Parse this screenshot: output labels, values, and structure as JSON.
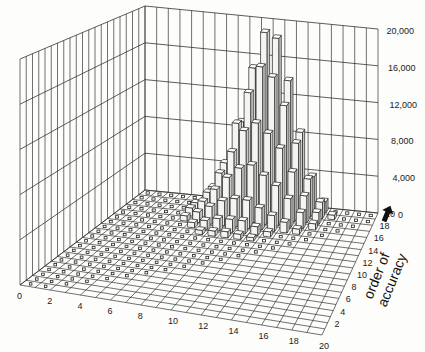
{
  "chart_data": {
    "type": "bar3d",
    "title": "",
    "xlabel": "",
    "ylabel": "order of accuracy",
    "zlabel": "",
    "x_ticks": [
      "0",
      "2",
      "4",
      "6",
      "8",
      "10",
      "12",
      "14",
      "16",
      "18",
      "20"
    ],
    "y_ticks": [
      "2",
      "4",
      "6",
      "8",
      "10",
      "12",
      "14",
      "16",
      "18",
      "20"
    ],
    "z_ticks": [
      "0",
      "4,000",
      "8,000",
      "12,000",
      "16,000",
      "20,000"
    ],
    "zlim": [
      0,
      20000
    ],
    "grid": true,
    "grid_size": [
      21,
      21
    ],
    "ylabel_arrow": "up-arrow",
    "bars": [
      {
        "x": 10,
        "y": 20,
        "z": 19000
      },
      {
        "x": 11,
        "y": 20,
        "z": 18500
      },
      {
        "x": 9,
        "y": 20,
        "z": 15000
      },
      {
        "x": 12,
        "y": 20,
        "z": 14000
      },
      {
        "x": 8,
        "y": 20,
        "z": 9000
      },
      {
        "x": 13,
        "y": 20,
        "z": 8500
      },
      {
        "x": 7,
        "y": 20,
        "z": 4000
      },
      {
        "x": 14,
        "y": 20,
        "z": 3800
      },
      {
        "x": 15,
        "y": 20,
        "z": 1200
      },
      {
        "x": 6,
        "y": 20,
        "z": 1300
      },
      {
        "x": 10,
        "y": 19,
        "z": 16000
      },
      {
        "x": 11,
        "y": 19,
        "z": 15000
      },
      {
        "x": 9,
        "y": 19,
        "z": 13000
      },
      {
        "x": 12,
        "y": 19,
        "z": 12000
      },
      {
        "x": 8,
        "y": 19,
        "z": 9500
      },
      {
        "x": 13,
        "y": 19,
        "z": 8000
      },
      {
        "x": 7,
        "y": 19,
        "z": 5000
      },
      {
        "x": 14,
        "y": 19,
        "z": 4200
      },
      {
        "x": 6,
        "y": 19,
        "z": 2200
      },
      {
        "x": 15,
        "y": 19,
        "z": 1800
      },
      {
        "x": 16,
        "y": 19,
        "z": 500
      },
      {
        "x": 10,
        "y": 18,
        "z": 10500
      },
      {
        "x": 11,
        "y": 18,
        "z": 9500
      },
      {
        "x": 9,
        "y": 18,
        "z": 9500
      },
      {
        "x": 12,
        "y": 18,
        "z": 8000
      },
      {
        "x": 8,
        "y": 18,
        "z": 7000
      },
      {
        "x": 13,
        "y": 18,
        "z": 5500
      },
      {
        "x": 7,
        "y": 18,
        "z": 4500
      },
      {
        "x": 14,
        "y": 18,
        "z": 3000
      },
      {
        "x": 6,
        "y": 18,
        "z": 2200
      },
      {
        "x": 15,
        "y": 18,
        "z": 1300
      },
      {
        "x": 5,
        "y": 18,
        "z": 900
      },
      {
        "x": 10,
        "y": 17,
        "z": 6500
      },
      {
        "x": 11,
        "y": 17,
        "z": 5500
      },
      {
        "x": 9,
        "y": 17,
        "z": 6000
      },
      {
        "x": 12,
        "y": 17,
        "z": 4500
      },
      {
        "x": 8,
        "y": 17,
        "z": 4800
      },
      {
        "x": 13,
        "y": 17,
        "z": 3200
      },
      {
        "x": 7,
        "y": 17,
        "z": 3300
      },
      {
        "x": 14,
        "y": 17,
        "z": 1800
      },
      {
        "x": 6,
        "y": 17,
        "z": 1800
      },
      {
        "x": 5,
        "y": 17,
        "z": 900
      },
      {
        "x": 15,
        "y": 17,
        "z": 700
      },
      {
        "x": 10,
        "y": 16,
        "z": 3200
      },
      {
        "x": 11,
        "y": 16,
        "z": 2500
      },
      {
        "x": 9,
        "y": 16,
        "z": 3200
      },
      {
        "x": 12,
        "y": 16,
        "z": 1800
      },
      {
        "x": 8,
        "y": 16,
        "z": 2800
      },
      {
        "x": 13,
        "y": 16,
        "z": 1200
      },
      {
        "x": 7,
        "y": 16,
        "z": 2000
      },
      {
        "x": 6,
        "y": 16,
        "z": 1200
      },
      {
        "x": 14,
        "y": 16,
        "z": 600
      },
      {
        "x": 5,
        "y": 16,
        "z": 600
      },
      {
        "x": 10,
        "y": 15,
        "z": 1500
      },
      {
        "x": 9,
        "y": 15,
        "z": 1500
      },
      {
        "x": 8,
        "y": 15,
        "z": 1400
      },
      {
        "x": 11,
        "y": 15,
        "z": 1000
      },
      {
        "x": 7,
        "y": 15,
        "z": 1000
      },
      {
        "x": 6,
        "y": 15,
        "z": 600
      },
      {
        "x": 12,
        "y": 15,
        "z": 600
      },
      {
        "x": 10,
        "y": 14,
        "z": 600
      },
      {
        "x": 9,
        "y": 14,
        "z": 700
      },
      {
        "x": 8,
        "y": 14,
        "z": 600
      },
      {
        "x": 7,
        "y": 14,
        "z": 500
      },
      {
        "x": 11,
        "y": 14,
        "z": 400
      }
    ],
    "note": "All other grid cells contain small near-zero markers (outlined squares) in the region x<=~14, y>=~8 diagonal band; values estimated from perspective heights."
  },
  "axes": {
    "x_tick_labels": [
      "0",
      "2",
      "4",
      "6",
      "8",
      "10",
      "12",
      "14",
      "16",
      "18",
      "20"
    ],
    "y_tick_labels": [
      "2",
      "4",
      "6",
      "8",
      "10",
      "12",
      "14",
      "16",
      "18",
      "20"
    ],
    "z_tick_labels": [
      "0",
      "4,000",
      "8,000",
      "12,000",
      "16,000",
      "20,000"
    ],
    "y_title_line1": "order of",
    "y_title_line2": "accuracy"
  }
}
